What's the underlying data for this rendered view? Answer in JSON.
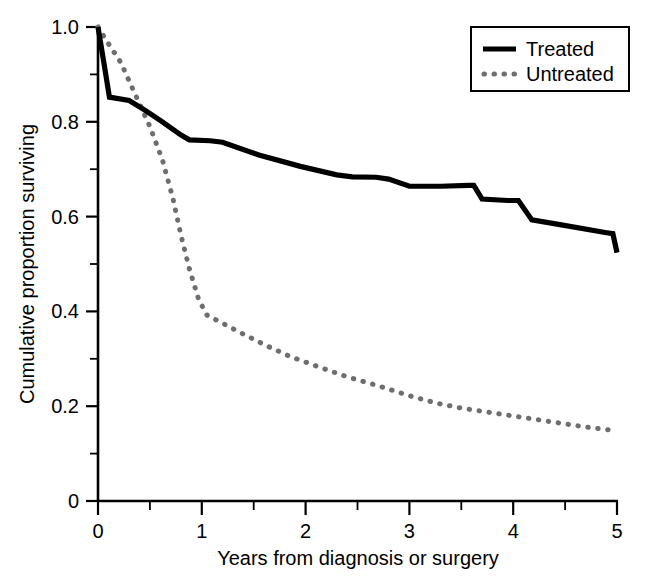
{
  "chart_data": {
    "type": "line",
    "title": "",
    "xlabel": "Years from diagnosis or surgery",
    "ylabel": "Cumulative proportion surviving",
    "xlim": [
      0,
      5
    ],
    "ylim": [
      0,
      1.0
    ],
    "grid": false,
    "legend_position": "top-right",
    "xticks": [
      0,
      1,
      2,
      3,
      4,
      5
    ],
    "xtick_labels": [
      "0",
      "1",
      "2",
      "3",
      "4",
      "5"
    ],
    "xminor_ticks": [
      0.5,
      1.5,
      2.5,
      3.5,
      4.5
    ],
    "yticks": [
      0,
      0.2,
      0.4,
      0.6,
      0.8,
      1.0
    ],
    "ytick_labels": [
      "0",
      "0.2",
      "0.4",
      "0.6",
      "0.8",
      "1.0"
    ],
    "yminor_ticks": [
      0.1,
      0.3,
      0.5,
      0.7,
      0.9
    ],
    "series": [
      {
        "name": "Treated",
        "style": "solid",
        "color": "#000000",
        "points": [
          [
            0.0,
            1.0
          ],
          [
            0.06,
            0.92
          ],
          [
            0.11,
            0.852
          ],
          [
            0.3,
            0.845
          ],
          [
            0.47,
            0.822
          ],
          [
            0.62,
            0.8
          ],
          [
            0.8,
            0.772
          ],
          [
            0.88,
            0.762
          ],
          [
            1.08,
            0.76
          ],
          [
            1.2,
            0.757
          ],
          [
            1.55,
            0.73
          ],
          [
            1.95,
            0.706
          ],
          [
            2.3,
            0.688
          ],
          [
            2.45,
            0.684
          ],
          [
            2.68,
            0.683
          ],
          [
            2.8,
            0.679
          ],
          [
            3.0,
            0.664
          ],
          [
            3.3,
            0.664
          ],
          [
            3.57,
            0.666
          ],
          [
            3.62,
            0.666
          ],
          [
            3.7,
            0.637
          ],
          [
            3.95,
            0.634
          ],
          [
            4.05,
            0.634
          ],
          [
            4.18,
            0.593
          ],
          [
            4.45,
            0.583
          ],
          [
            4.9,
            0.566
          ],
          [
            4.96,
            0.564
          ],
          [
            5.0,
            0.524
          ]
        ]
      },
      {
        "name": "Untreated",
        "style": "dotted",
        "color": "#6e6e6e",
        "points": [
          [
            0.0,
            1.0
          ],
          [
            0.1,
            0.965
          ],
          [
            0.22,
            0.925
          ],
          [
            0.35,
            0.862
          ],
          [
            0.5,
            0.79
          ],
          [
            0.62,
            0.72
          ],
          [
            0.72,
            0.64
          ],
          [
            0.8,
            0.56
          ],
          [
            0.88,
            0.49
          ],
          [
            0.97,
            0.425
          ],
          [
            1.05,
            0.392
          ],
          [
            1.2,
            0.375
          ],
          [
            1.4,
            0.352
          ],
          [
            1.6,
            0.33
          ],
          [
            1.85,
            0.305
          ],
          [
            2.1,
            0.285
          ],
          [
            2.4,
            0.262
          ],
          [
            2.7,
            0.243
          ],
          [
            3.0,
            0.222
          ],
          [
            3.25,
            0.207
          ],
          [
            3.5,
            0.196
          ],
          [
            3.8,
            0.186
          ],
          [
            4.1,
            0.176
          ],
          [
            4.4,
            0.166
          ],
          [
            4.7,
            0.156
          ],
          [
            5.0,
            0.148
          ]
        ]
      }
    ],
    "legend": [
      {
        "label": "Treated",
        "style": "solid",
        "color": "#000000"
      },
      {
        "label": "Untreated",
        "style": "dotted",
        "color": "#6e6e6e"
      }
    ]
  }
}
